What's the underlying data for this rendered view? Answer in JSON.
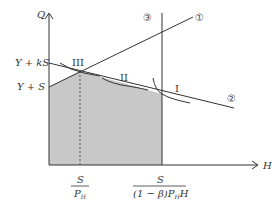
{
  "diagram": {
    "axes": {
      "y_label": "Q",
      "x_label": "H"
    },
    "y_ticks": [
      {
        "label": "Y + kS"
      },
      {
        "label": "Y + S"
      }
    ],
    "x_ticks": [
      {
        "numerator": "S",
        "denominator": "P",
        "denominator_sub": "H"
      },
      {
        "numerator": "S",
        "denominator_pre": "(1 − β)P",
        "denominator_sub": "H",
        "denominator_post": "H"
      }
    ],
    "line_labels": {
      "line1": "①",
      "line2": "②",
      "line3": "③"
    },
    "point_labels": {
      "p1": "I",
      "p2": "II",
      "p3": "III"
    },
    "colors": {
      "shade": "#c8c8c8",
      "line": "#333333"
    }
  }
}
